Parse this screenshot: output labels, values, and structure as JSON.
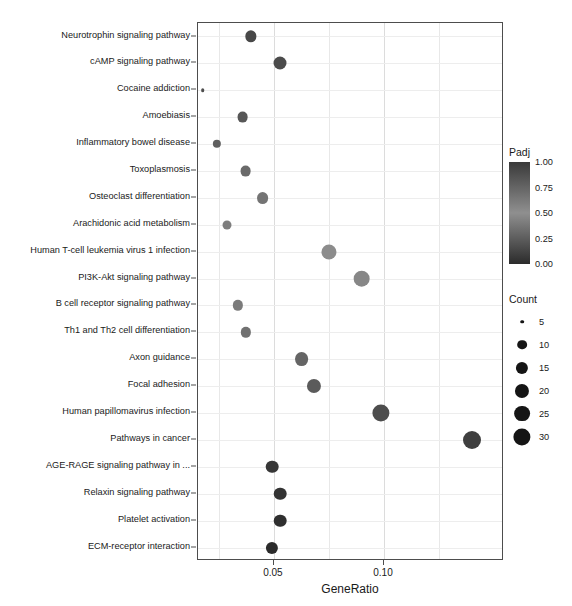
{
  "chart_data": {
    "type": "scatter",
    "title": "",
    "xlabel": "GeneRatio",
    "ylabel": "",
    "xlim": [
      0.0155,
      0.1545
    ],
    "xticks": [
      0.05,
      0.1
    ],
    "xtick_labels": [
      "0.05",
      "0.10"
    ],
    "minor_xticks": [
      0.025,
      0.075,
      0.125
    ],
    "grid": true,
    "legend_position": "right",
    "categories": [
      "Neurotrophin signaling pathway",
      "cAMP signaling pathway",
      "Cocaine addiction",
      "Amoebiasis",
      "Inflammatory bowel disease",
      "Toxoplasmosis",
      "Osteoclast differentiation",
      "Arachidonic acid metabolism",
      "Human T-cell leukemia virus 1 infection",
      "PI3K-Akt signaling pathway",
      "B cell receptor signaling pathway",
      "Th1 and Th2 cell differentiation",
      "Axon guidance",
      "Focal adhesion",
      "Human papillomavirus infection",
      "Pathways in cancer",
      "AGE-RAGE signaling pathway in ...",
      "Relaxin signaling pathway",
      "Platelet activation",
      "ECM-receptor interaction"
    ],
    "points": [
      {
        "label": "Neurotrophin signaling pathway",
        "gene_ratio": 0.0395,
        "count": 13,
        "padj": 0.92
      },
      {
        "label": "cAMP signaling pathway",
        "gene_ratio": 0.0528,
        "count": 17,
        "padj": 0.9
      },
      {
        "label": "Cocaine addiction",
        "gene_ratio": 0.0177,
        "count": 5,
        "padj": 0.88
      },
      {
        "label": "Amoebiasis",
        "gene_ratio": 0.0358,
        "count": 12,
        "padj": 0.83
      },
      {
        "label": "Inflammatory bowel disease",
        "gene_ratio": 0.024,
        "count": 8,
        "padj": 0.78
      },
      {
        "label": "Toxoplasmosis",
        "gene_ratio": 0.0371,
        "count": 12,
        "padj": 0.72
      },
      {
        "label": "Osteoclast differentiation",
        "gene_ratio": 0.0449,
        "count": 14,
        "padj": 0.66
      },
      {
        "label": "Arachidonic acid metabolism",
        "gene_ratio": 0.0286,
        "count": 9,
        "padj": 0.6
      },
      {
        "label": "Human T-cell leukemia virus 1 infection",
        "gene_ratio": 0.0748,
        "count": 23,
        "padj": 0.52
      },
      {
        "label": "PI3K-Akt signaling pathway",
        "gene_ratio": 0.0898,
        "count": 28,
        "padj": 0.46
      },
      {
        "label": "B cell receptor signaling pathway",
        "gene_ratio": 0.0336,
        "count": 11,
        "padj": 0.4
      },
      {
        "label": "Th1 and Th2 cell differentiation",
        "gene_ratio": 0.0371,
        "count": 11,
        "padj": 0.35
      },
      {
        "label": "Axon guidance",
        "gene_ratio": 0.0625,
        "count": 19,
        "padj": 0.29
      },
      {
        "label": "Focal adhesion",
        "gene_ratio": 0.0682,
        "count": 20,
        "padj": 0.24
      },
      {
        "label": "Human papillomavirus infection",
        "gene_ratio": 0.0987,
        "count": 30,
        "padj": 0.17
      },
      {
        "label": "Pathways in cancer",
        "gene_ratio": 0.14,
        "count": 33,
        "padj": 0.1
      },
      {
        "label": "AGE-RAGE signaling pathway in ...",
        "gene_ratio": 0.0492,
        "count": 16,
        "padj": 0.06
      },
      {
        "label": "Relaxin signaling pathway",
        "gene_ratio": 0.0528,
        "count": 16,
        "padj": 0.04
      },
      {
        "label": "Platelet activation",
        "gene_ratio": 0.0528,
        "count": 16,
        "padj": 0.02
      },
      {
        "label": "ECM-receptor interaction",
        "gene_ratio": 0.0492,
        "count": 15,
        "padj": 0.0
      }
    ]
  },
  "legends": {
    "padj": {
      "title": "Padj",
      "tick_labels": [
        "1.00",
        "0.75",
        "0.50",
        "0.25",
        "0.00"
      ],
      "tick_values": [
        1.0,
        0.75,
        0.5,
        0.25,
        0.0
      ],
      "color_high": "#3a3a3a",
      "color_mid": "#8f8f8f",
      "color_low": "#2b2b2b"
    },
    "count": {
      "title": "Count",
      "labels": [
        "5",
        "10",
        "15",
        "20",
        "25",
        "30"
      ],
      "values": [
        5,
        10,
        15,
        20,
        25,
        30
      ],
      "marker_color": "#151515"
    }
  },
  "axis": {
    "x_title": "GeneRatio",
    "x_tick_labels": [
      "0.05",
      "0.10"
    ]
  }
}
